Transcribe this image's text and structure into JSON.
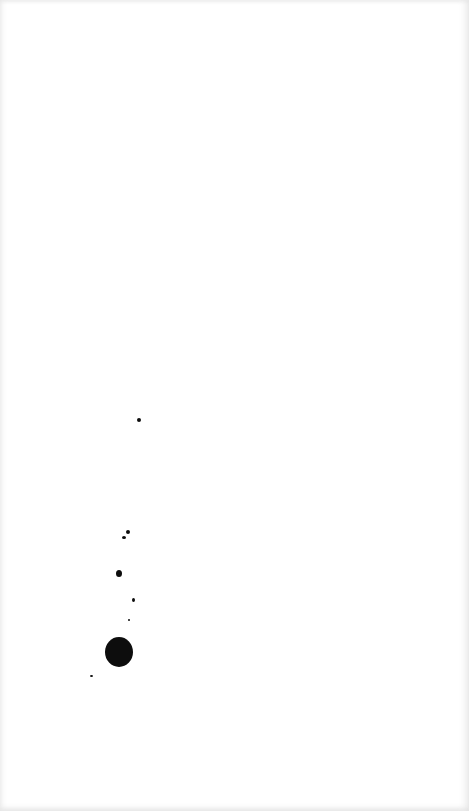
{
  "page": {
    "background": "#ffffff",
    "ink_color": "#0d0d0d"
  },
  "spots": [
    {
      "x": 137,
      "y": 418,
      "w": 4,
      "h": 4
    },
    {
      "x": 126,
      "y": 530,
      "w": 4,
      "h": 4
    },
    {
      "x": 122,
      "y": 536,
      "w": 4,
      "h": 3
    },
    {
      "x": 116,
      "y": 570,
      "w": 6,
      "h": 7
    },
    {
      "x": 132,
      "y": 598,
      "w": 3,
      "h": 4
    },
    {
      "x": 128,
      "y": 619,
      "w": 2,
      "h": 2
    },
    {
      "x": 105,
      "y": 637,
      "w": 28,
      "h": 30
    },
    {
      "x": 90,
      "y": 675,
      "w": 3,
      "h": 2
    }
  ]
}
